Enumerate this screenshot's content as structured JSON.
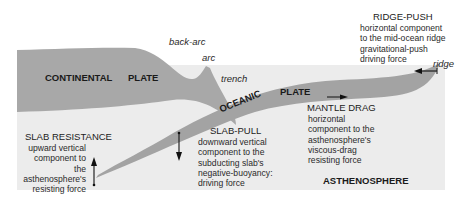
{
  "colors": {
    "background": "#ffffff",
    "asthenosphere": "#ececec",
    "continental_plate": "#a8a8a8",
    "oceanic_plate": "#a3a3a3",
    "text": "#1a1a1a"
  },
  "plates": {
    "continental_label": "CONTINENTAL",
    "continental_plate_label": "PLATE",
    "oceanic_label": "OCEANIC",
    "oceanic_plate_label": "PLATE",
    "asthenosphere_label": "ASTHENOSPHERE"
  },
  "features": {
    "back_arc": "back-arc",
    "arc": "arc",
    "trench": "trench",
    "ridge": "ridge"
  },
  "forces": {
    "ridge_push": {
      "title": "RIDGE-PUSH",
      "description": "horizontal component to the mid-ocean ridge gravitational-push driving force",
      "lines": [
        "horizontal component",
        "to the mid-ocean ridge",
        "gravitational-push",
        "driving force"
      ]
    },
    "mantle_drag": {
      "title": "MANTLE DRAG",
      "lines": [
        "horizontal",
        "component to the",
        "asthenosphere's",
        "viscous-drag",
        "resisting force"
      ]
    },
    "slab_pull": {
      "title": "SLAB-PULL",
      "lines": [
        "downward vertical",
        "component to the",
        "subducting slab's",
        "negative-buoyancy:",
        "driving force"
      ]
    },
    "slab_resistance": {
      "title": "SLAB RESISTANCE",
      "lines": [
        "upward vertical",
        "component to the",
        "asthenosphere's",
        "resisting force"
      ]
    }
  },
  "icons": {
    "ridge_push_arrow": "arrow-left",
    "mantle_drag_arrow": "arrow-right",
    "slab_pull_arrow": "arrow-down",
    "slab_resistance_arrow": "arrow-up"
  }
}
